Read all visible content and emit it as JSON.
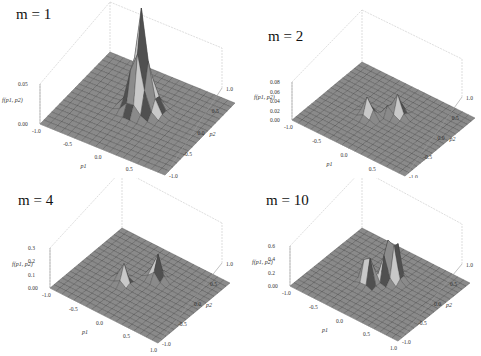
{
  "figure": {
    "layout": "2x2 grid of 3D surface plots",
    "background": "#ffffff",
    "surface_color": "#8a8a8a",
    "mesh_color": "#3c3c3c",
    "box_color": "#c8c8c8"
  },
  "chart_data": [
    {
      "type": "surface3d",
      "title": "m = 1",
      "xlabel": "p1",
      "ylabel": "p2",
      "zlabel": "f(p1, p2)",
      "x_ticks": [
        "-1.0",
        "-0.5",
        "0.0",
        "0.5",
        "1.0"
      ],
      "y_ticks": [
        "-1.0",
        "-0.5",
        "0.0",
        "0.5",
        "1.0"
      ],
      "z_ticks": [
        "0.00",
        "0.05"
      ],
      "xlim": [
        -1,
        1
      ],
      "ylim": [
        -1,
        1
      ],
      "description": "single sharp central peak with smooth tail, flat elsewhere"
    },
    {
      "type": "surface3d",
      "title": "m = 2",
      "xlabel": "p1",
      "ylabel": "p2",
      "zlabel": "f(p1, p2)",
      "x_ticks": [
        "-1.0",
        "-0.5",
        "0.0",
        "0.5",
        "1.0"
      ],
      "y_ticks": [
        "-1.0",
        "-0.5",
        "0.0",
        "0.5",
        "1.0"
      ],
      "z_ticks": [
        "0.00",
        "0.02",
        "0.04",
        "0.06",
        "0.08"
      ],
      "xlim": [
        -1,
        1
      ],
      "ylim": [
        -1,
        1
      ],
      "description": "narrow central spike with two side lobes"
    },
    {
      "type": "surface3d",
      "title": "m = 4",
      "xlabel": "p1",
      "ylabel": "p2",
      "zlabel": "f(p1, p2)",
      "x_ticks": [
        "-1.0",
        "-0.5",
        "0.0",
        "0.5",
        "1.0"
      ],
      "y_ticks": [
        "-1.0",
        "-0.5",
        "0.0",
        "0.5",
        "1.0"
      ],
      "z_ticks": [
        "0.00",
        "0.1",
        "0.2",
        "0.3"
      ],
      "xlim": [
        -1,
        1
      ],
      "ylim": [
        -1,
        1
      ],
      "description": "thin central spike with two separated lobes"
    },
    {
      "type": "surface3d",
      "title": "m = 10",
      "xlabel": "p1",
      "ylabel": "p2",
      "zlabel": "f(p1, p2)",
      "x_ticks": [
        "-1.0",
        "-0.5",
        "0.0",
        "0.5",
        "1.0"
      ],
      "y_ticks": [
        "-1.0",
        "-0.5",
        "0.0",
        "0.5",
        "1.0"
      ],
      "z_ticks": [
        "0.00",
        "0.2",
        "0.4",
        "0.6"
      ],
      "xlim": [
        -1,
        1
      ],
      "ylim": [
        -1,
        1
      ],
      "description": "two tall oscillating lobes near center"
    }
  ],
  "panels": [
    {
      "title": "m = 1",
      "zlabel": "f(p1, p2)",
      "xlabel": "p1",
      "ylabel": "p2",
      "xt": [
        "-1.0",
        "-0.5",
        "0.0",
        "0.5",
        "1.0"
      ],
      "yt": [
        "-1.0",
        "-0.5",
        "0.0",
        "0.5",
        "1.0"
      ],
      "zt": [
        "0.00",
        "0.05"
      ]
    },
    {
      "title": "m = 2",
      "zlabel": "f(p1, p2)",
      "xlabel": "p1",
      "ylabel": "p2",
      "xt": [
        "-1.0",
        "-0.5",
        "0.0",
        "0.5",
        "1.0"
      ],
      "yt": [
        "-1.0",
        "-0.5",
        "0.0",
        "0.5",
        "1.0"
      ],
      "zt": [
        "0.00",
        "0.02",
        "0.04",
        "0.06",
        "0.08"
      ]
    },
    {
      "title": "m = 4",
      "zlabel": "f(p1, p2)",
      "xlabel": "p1",
      "ylabel": "p2",
      "xt": [
        "-1.0",
        "-0.5",
        "0.0",
        "0.5",
        "1.0"
      ],
      "yt": [
        "-1.0",
        "-0.5",
        "0.0",
        "0.5",
        "1.0"
      ],
      "zt": [
        "0.00",
        "0.1",
        "0.2",
        "0.3"
      ]
    },
    {
      "title": "m = 10",
      "zlabel": "f(p1, p2)",
      "xlabel": "p1",
      "ylabel": "p2",
      "xt": [
        "-1.0",
        "-0.5",
        "0.0",
        "0.5",
        "1.0"
      ],
      "yt": [
        "-1.0",
        "-0.5",
        "0.0",
        "0.5",
        "1.0"
      ],
      "zt": [
        "0.00",
        "0.2",
        "0.4",
        "0.6"
      ]
    }
  ]
}
